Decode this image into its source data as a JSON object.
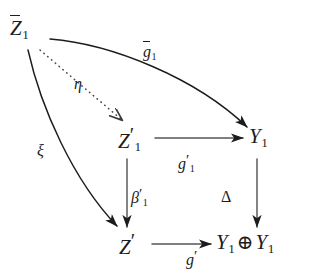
{
  "diagram": {
    "type": "commutative-diagram",
    "background_color": "#ffffff",
    "ink_color": "#1c1c1c",
    "width": 310,
    "height": 273,
    "nodes": [
      {
        "id": "zbar1",
        "label": "Z̄1",
        "base": "Z",
        "accent": "bar",
        "subscript": "1",
        "prime": false,
        "x": 27,
        "y": 31
      },
      {
        "id": "zprime1",
        "label": "Z′1",
        "base": "Z",
        "accent": "none",
        "subscript": "1",
        "prime": true,
        "x": 132,
        "y": 138
      },
      {
        "id": "y1",
        "label": "Y1",
        "base": "Y",
        "accent": "none",
        "subscript": "1",
        "prime": false,
        "x": 262,
        "y": 138
      },
      {
        "id": "zprime",
        "label": "Z′",
        "base": "Z",
        "accent": "none",
        "subscript": "",
        "prime": true,
        "x": 132,
        "y": 244
      },
      {
        "id": "y1y1",
        "label": "Y1 ⊕ Y1",
        "base": "Y",
        "accent": "none",
        "subscript": "1",
        "prime": false,
        "x": 258,
        "y": 244
      }
    ],
    "edges": [
      {
        "id": "gbar1",
        "label": "ḡ1",
        "from": "zbar1",
        "to": "y1",
        "style": "solid-curved",
        "label_x": 143,
        "label_y": 44
      },
      {
        "id": "eta",
        "label": "η",
        "from": "zbar1",
        "to": "zprime1",
        "style": "dotted",
        "label_x": 74,
        "label_y": 76
      },
      {
        "id": "xi",
        "label": "ξ",
        "from": "zbar1",
        "to": "zprime",
        "style": "solid-curved",
        "label_x": 37,
        "label_y": 143
      },
      {
        "id": "gprime1",
        "label": "g′1",
        "from": "zprime1",
        "to": "y1",
        "style": "solid",
        "label_x": 178,
        "label_y": 152
      },
      {
        "id": "beta1",
        "label": "β′1",
        "from": "zprime1",
        "to": "zprime",
        "style": "solid",
        "label_x": 131,
        "label_y": 186
      },
      {
        "id": "delta",
        "label": "Δ",
        "from": "y1",
        "to": "y1y1",
        "style": "solid",
        "label_x": 221,
        "label_y": 189
      },
      {
        "id": "gprime",
        "label": "g′",
        "from": "zprime",
        "to": "y1y1",
        "style": "solid",
        "label_x": 186,
        "label_y": 248
      }
    ]
  },
  "nodes": {
    "zbar1": {
      "base": "Z",
      "sub": "1"
    },
    "zprime1": {
      "base": "Z",
      "prime": "′",
      "sub": "1"
    },
    "y1": {
      "base": "Y",
      "sub": "1"
    },
    "zprime": {
      "base": "Z",
      "prime": "′"
    },
    "y1y1": {
      "base_left": "Y",
      "sub_left": "1",
      "oplus": "⊕",
      "base_right": "Y",
      "sub_right": "1"
    }
  },
  "labels": {
    "gbar1": {
      "base": "g",
      "sub": "1"
    },
    "eta": {
      "glyph": "η"
    },
    "xi": {
      "glyph": "ξ"
    },
    "gprime1": {
      "base": "g",
      "prime": "′",
      "sub": "1"
    },
    "beta1": {
      "base": "β",
      "prime": "′",
      "sub": "1"
    },
    "delta": {
      "glyph": "Δ"
    },
    "gprime": {
      "base": "g",
      "prime": "′"
    }
  }
}
